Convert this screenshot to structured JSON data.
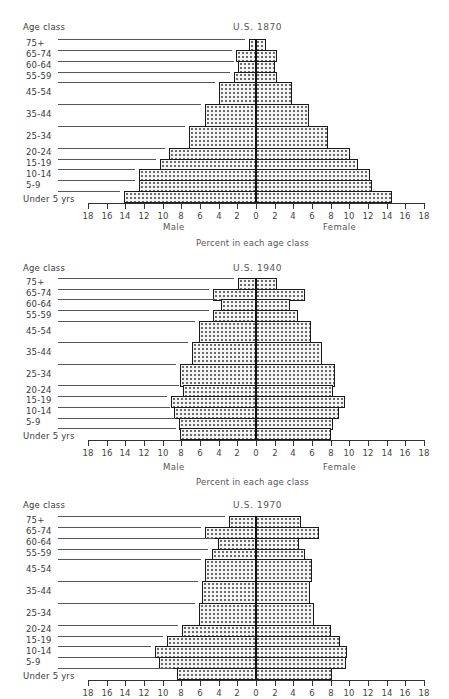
{
  "chart_data": [
    {
      "type": "bar",
      "subtype": "population-pyramid",
      "title": "U.S. 1870",
      "ylabel": "Age class",
      "xlabel": "Percent in each age class",
      "left_label": "Male",
      "right_label": "Female",
      "xlim": [
        -18,
        18
      ],
      "xticks": [
        18,
        16,
        14,
        12,
        10,
        8,
        6,
        4,
        2,
        0,
        2,
        4,
        6,
        8,
        10,
        12,
        14,
        16,
        18
      ],
      "categories": [
        "75+",
        "65-74",
        "60-64",
        "55-59",
        "45-54",
        "35-44",
        "25-34",
        "20-24",
        "15-19",
        "10-14",
        "5-9",
        "Under 5 yrs"
      ],
      "series": [
        {
          "name": "Male",
          "values": [
            0.8,
            2.1,
            1.9,
            2.4,
            4.0,
            5.5,
            7.2,
            9.3,
            10.3,
            12.5,
            12.5,
            14.2
          ]
        },
        {
          "name": "Female",
          "values": [
            1.1,
            2.3,
            2.0,
            2.3,
            3.9,
            5.7,
            7.7,
            10.1,
            10.9,
            12.2,
            12.4,
            14.6
          ]
        }
      ],
      "grid": false
    },
    {
      "type": "bar",
      "subtype": "population-pyramid",
      "title": "U.S. 1940",
      "ylabel": "Age class",
      "xlabel": "Percent in each age class",
      "left_label": "Male",
      "right_label": "Female",
      "xlim": [
        -18,
        18
      ],
      "xticks": [
        18,
        16,
        14,
        12,
        10,
        8,
        6,
        4,
        2,
        0,
        2,
        4,
        6,
        8,
        10,
        12,
        14,
        16,
        18
      ],
      "categories": [
        "75+",
        "65-74",
        "60-64",
        "55-59",
        "45-54",
        "35-44",
        "25-34",
        "20-24",
        "15-19",
        "10-14",
        "5-9",
        "Under 5 yrs"
      ],
      "series": [
        {
          "name": "Male",
          "values": [
            1.9,
            4.6,
            3.8,
            4.6,
            6.1,
            6.9,
            8.1,
            7.8,
            9.1,
            8.8,
            8.3,
            8.1
          ]
        },
        {
          "name": "Female",
          "values": [
            2.3,
            5.2,
            3.6,
            4.5,
            5.9,
            7.1,
            8.5,
            8.2,
            9.5,
            8.9,
            8.2,
            8.0
          ]
        }
      ],
      "grid": false
    },
    {
      "type": "bar",
      "subtype": "population-pyramid",
      "title": "U.S. 1970",
      "ylabel": "Age class",
      "xlabel": "",
      "left_label": "",
      "right_label": "",
      "xlim": [
        -18,
        18
      ],
      "xticks": [
        18,
        16,
        14,
        12,
        10,
        8,
        6,
        4,
        2,
        0,
        2,
        4,
        6,
        8,
        10,
        12,
        14,
        16,
        18
      ],
      "categories": [
        "75+",
        "65-74",
        "60-64",
        "55-59",
        "45-54",
        "35-44",
        "25-34",
        "20-24",
        "15-19",
        "10-14",
        "5-9",
        "Under 5 yrs"
      ],
      "series": [
        {
          "name": "Male",
          "values": [
            2.9,
            5.5,
            4.1,
            4.7,
            5.5,
            5.8,
            6.1,
            7.9,
            9.5,
            10.8,
            10.4,
            8.5
          ]
        },
        {
          "name": "Female",
          "values": [
            4.8,
            6.8,
            4.6,
            5.2,
            6.0,
            5.8,
            6.2,
            8.0,
            9.0,
            9.8,
            9.6,
            8.1
          ]
        }
      ],
      "grid": false
    }
  ],
  "charts": [
    {
      "title": "U.S. 1870",
      "ylabel": "Age class",
      "male": "Male",
      "female": "Female",
      "xlabel": "Percent in each age class"
    },
    {
      "title": "U.S. 1940",
      "ylabel": "Age class",
      "male": "Male",
      "female": "Female",
      "xlabel": "Percent in each age class"
    },
    {
      "title": "U.S. 1970",
      "ylabel": "Age class",
      "male": "",
      "female": "",
      "xlabel": ""
    }
  ],
  "colors": {
    "ink": "#1a1a1a",
    "dots": "#6a6a6a",
    "fill": "#f4f4f4"
  }
}
